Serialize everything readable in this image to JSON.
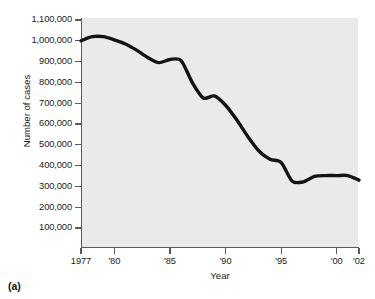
{
  "figure": {
    "panel_label": "(a)"
  },
  "chart_data": {
    "type": "line",
    "title": "",
    "xlabel": "Year",
    "ylabel": "Number of cases",
    "xlim": [
      1977,
      2002
    ],
    "ylim": [
      0,
      1100000
    ],
    "grid": false,
    "legend": null,
    "x_tick_labels": [
      "1977",
      "'80",
      "'85",
      "'90",
      "'95",
      "'00",
      "'02"
    ],
    "x_tick_values": [
      1977,
      1980,
      1985,
      1990,
      1995,
      2000,
      2002
    ],
    "y_tick_labels": [
      "1,100,000",
      "1,000,000",
      "900,000",
      "800,000",
      "700,000",
      "600,000",
      "500,000",
      "400,000",
      "300,000",
      "200,000",
      "100,000"
    ],
    "y_tick_values": [
      1100000,
      1000000,
      900000,
      800000,
      700000,
      600000,
      500000,
      400000,
      300000,
      200000,
      100000
    ],
    "series": [
      {
        "name": "Number of cases",
        "color": "#141414",
        "x": [
          1977,
          1978,
          1979,
          1980,
          1981,
          1982,
          1983,
          1984,
          1985,
          1986,
          1987,
          1988,
          1989,
          1990,
          1991,
          1992,
          1993,
          1994,
          1995,
          1996,
          1997,
          1998,
          1999,
          2000,
          2001,
          2002
        ],
        "values": [
          1000000,
          1020000,
          1020000,
          1005000,
          985000,
          955000,
          920000,
          895000,
          910000,
          905000,
          800000,
          725000,
          735000,
          690000,
          620000,
          540000,
          470000,
          430000,
          415000,
          325000,
          322000,
          348000,
          352000,
          352000,
          352000,
          330000
        ]
      }
    ]
  }
}
